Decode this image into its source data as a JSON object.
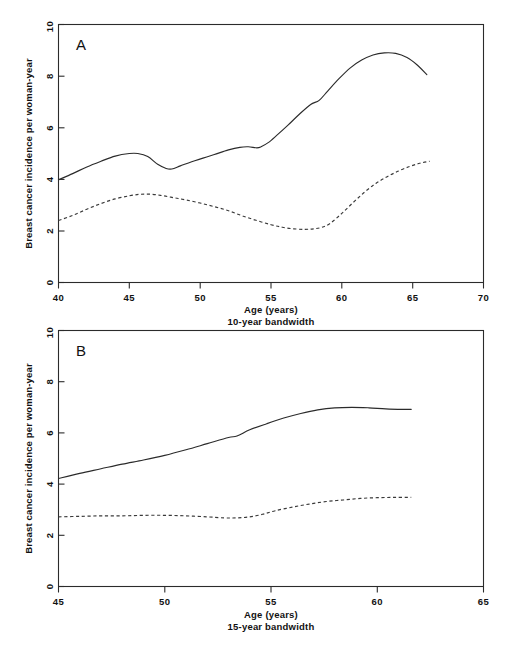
{
  "figure": {
    "width": 516,
    "height": 647,
    "background": "#ffffff",
    "ink_color": "#2b2b2b"
  },
  "chart_data": [
    {
      "type": "line",
      "panel": "A",
      "panel_letter": "A",
      "title": "",
      "xlabel": "Age (years)",
      "xsublabel": "10-year bandwidth",
      "ylabel": "Breast cancer incidence per woman-year",
      "xlim": [
        40,
        70
      ],
      "ylim": [
        0,
        10
      ],
      "xticks": [
        40,
        45,
        50,
        55,
        60,
        65,
        70
      ],
      "xticklabels": [
        "40",
        "45",
        "50",
        "55",
        "60",
        "65",
        "70"
      ],
      "yticks": [
        0,
        2,
        4,
        6,
        8,
        10
      ],
      "yticklabels": [
        "0",
        "2",
        "4",
        "6",
        "8",
        "10"
      ],
      "grid": false,
      "legend": "none",
      "series": [
        {
          "name": "solid-curve",
          "style": "solid",
          "x": [
            40.0,
            41.0,
            42.0,
            43.0,
            44.0,
            45.0,
            45.6,
            46.3,
            47.0,
            47.6,
            48.0,
            48.6,
            49.4,
            50.2,
            51.0,
            52.0,
            52.8,
            53.4,
            54.0,
            54.3,
            54.8,
            55.4,
            56.2,
            57.0,
            57.8,
            58.4,
            59.0,
            59.8,
            60.6,
            61.4,
            62.2,
            63.0,
            63.8,
            64.6,
            65.3,
            66.0
          ],
          "y": [
            3.98,
            4.22,
            4.48,
            4.7,
            4.9,
            5.0,
            5.0,
            4.88,
            4.58,
            4.42,
            4.4,
            4.52,
            4.68,
            4.82,
            4.96,
            5.14,
            5.24,
            5.26,
            5.22,
            5.26,
            5.42,
            5.7,
            6.1,
            6.52,
            6.9,
            7.06,
            7.42,
            7.9,
            8.32,
            8.62,
            8.82,
            8.9,
            8.88,
            8.72,
            8.44,
            8.06
          ]
        },
        {
          "name": "dashed-curve",
          "style": "dashed",
          "x": [
            40.0,
            41.0,
            42.0,
            43.0,
            44.0,
            45.0,
            45.8,
            46.6,
            47.4,
            48.2,
            49.0,
            50.0,
            51.0,
            52.0,
            53.0,
            54.0,
            55.0,
            55.8,
            56.6,
            57.4,
            58.0,
            58.6,
            59.2,
            60.0,
            60.8,
            61.6,
            62.4,
            63.2,
            64.0,
            64.8,
            65.5,
            66.2
          ],
          "y": [
            2.4,
            2.6,
            2.84,
            3.06,
            3.24,
            3.36,
            3.42,
            3.42,
            3.36,
            3.28,
            3.2,
            3.08,
            2.94,
            2.78,
            2.58,
            2.4,
            2.24,
            2.14,
            2.08,
            2.06,
            2.08,
            2.14,
            2.3,
            2.68,
            3.1,
            3.5,
            3.84,
            4.1,
            4.32,
            4.5,
            4.62,
            4.7
          ]
        }
      ]
    },
    {
      "type": "line",
      "panel": "B",
      "panel_letter": "B",
      "title": "",
      "xlabel": "Age (years)",
      "xsublabel": "15-year bandwidth",
      "ylabel": "Breast cancer incidence per woman-year",
      "xlim": [
        45,
        65
      ],
      "ylim": [
        0,
        10
      ],
      "xticks": [
        45,
        50,
        55,
        60,
        65
      ],
      "xticklabels": [
        "45",
        "50",
        "55",
        "60",
        "65"
      ],
      "yticks": [
        0,
        2,
        4,
        6,
        8,
        10
      ],
      "yticklabels": [
        "0",
        "2",
        "4",
        "6",
        "8",
        "10"
      ],
      "grid": false,
      "legend": "none",
      "series": [
        {
          "name": "solid-curve",
          "style": "solid",
          "x": [
            45.0,
            46.0,
            47.0,
            48.0,
            49.0,
            50.0,
            51.0,
            52.0,
            53.0,
            53.4,
            54.0,
            54.8,
            55.6,
            56.4,
            57.2,
            58.0,
            58.8,
            59.6,
            60.4,
            61.2,
            61.6
          ],
          "y": [
            4.22,
            4.42,
            4.6,
            4.78,
            4.94,
            5.12,
            5.34,
            5.58,
            5.82,
            5.88,
            6.12,
            6.36,
            6.58,
            6.76,
            6.9,
            6.98,
            7.0,
            6.98,
            6.94,
            6.92,
            6.92
          ]
        },
        {
          "name": "dashed-curve",
          "style": "dashed",
          "x": [
            45.0,
            46.0,
            47.0,
            48.0,
            49.0,
            50.0,
            51.0,
            52.0,
            52.8,
            53.4,
            54.0,
            54.6,
            55.2,
            56.0,
            56.8,
            57.6,
            58.4,
            59.2,
            60.0,
            60.8,
            61.6
          ],
          "y": [
            2.72,
            2.74,
            2.76,
            2.76,
            2.78,
            2.78,
            2.76,
            2.72,
            2.68,
            2.68,
            2.72,
            2.82,
            2.96,
            3.1,
            3.22,
            3.32,
            3.38,
            3.44,
            3.47,
            3.48,
            3.48
          ]
        }
      ]
    }
  ]
}
